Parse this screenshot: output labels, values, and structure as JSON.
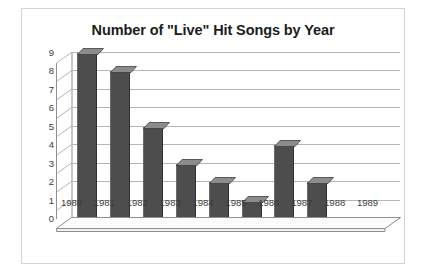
{
  "chart_data": {
    "type": "bar",
    "title": "Number of \"Live\" Hit Songs by Year",
    "xlabel": "",
    "ylabel": "",
    "categories": [
      "1980",
      "1981",
      "1982",
      "1983",
      "1984",
      "1985",
      "1986",
      "1987",
      "1988",
      "1989"
    ],
    "values": [
      9,
      8,
      5,
      3,
      2,
      1,
      4,
      2,
      0,
      0
    ],
    "ylim": [
      0,
      9
    ],
    "ytick_step": 1,
    "yticks": [
      "0",
      "1",
      "2",
      "3",
      "4",
      "5",
      "6",
      "7",
      "8",
      "9"
    ],
    "grid": true,
    "legend": false,
    "legend_position": "none",
    "style_3d": true,
    "series": [
      {
        "name": "Number of \"Live\" Hit Songs",
        "values": [
          9,
          8,
          5,
          3,
          2,
          1,
          4,
          2,
          0,
          0
        ]
      }
    ],
    "colors": {
      "bar_fill": "#4d4d4d",
      "bar_top": "#8c8c8c",
      "gridline": "#b6b6b6",
      "axis": "#8f8f8f",
      "frame_border": "#d4d4d4",
      "background": "#ffffff",
      "title_text": "#1c1c1c",
      "tick_text": "#3a3a3a"
    }
  }
}
